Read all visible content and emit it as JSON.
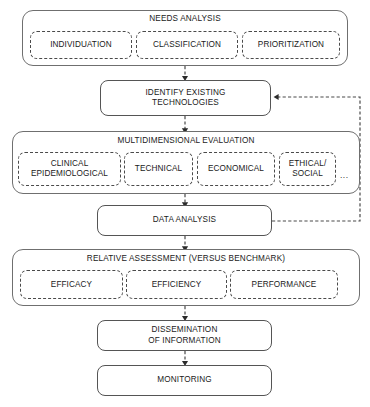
{
  "diagram": {
    "background_color": "#ffffff",
    "line_color": "#4a4a4a",
    "text_color": "#1a1a1a",
    "ellipsis": "..."
  },
  "stages": {
    "needs_analysis": {
      "label": "NEEDS ANALYSIS",
      "items": [
        {
          "label": "INDIVIDUATION"
        },
        {
          "label": "CLASSIFICATION"
        },
        {
          "label": "PRIORITIZATION"
        }
      ]
    },
    "identify_existing": {
      "line1": "IDENTIFY EXISTING",
      "line2": "TECHNOLOGIES"
    },
    "multidimensional_evaluation": {
      "label": "MULTIDIMENSIONAL EVALUATION",
      "items": [
        {
          "line1": "CLINICAL",
          "line2": "EPIDEMIOLOGICAL"
        },
        {
          "line1": "TECHNICAL",
          "line2": ""
        },
        {
          "line1": "ECONOMICAL",
          "line2": ""
        },
        {
          "line1": "ETHICAL/",
          "line2": "SOCIAL"
        }
      ]
    },
    "data_analysis": {
      "label": "DATA ANALYSIS"
    },
    "relative_assessment": {
      "label": "RELATIVE ASSESSMENT (VERSUS BENCHMARK)",
      "items": [
        {
          "label": "EFFICACY"
        },
        {
          "label": "EFFICIENCY"
        },
        {
          "label": "PERFORMANCE"
        }
      ]
    },
    "dissemination": {
      "line1": "DISSEMINATION",
      "line2": "OF INFORMATION"
    },
    "monitoring": {
      "label": "MONITORING"
    }
  }
}
